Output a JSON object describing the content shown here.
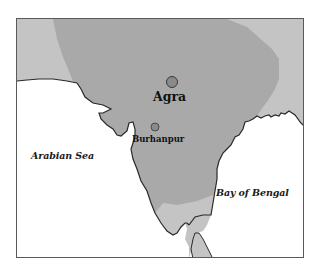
{
  "map": {
    "title": "",
    "colors": {
      "sea": "#ffffff",
      "land_outer": "#c4c4c4",
      "empire": "#a9a9a9",
      "coastline": "#2a2a2a",
      "city_marker": "#8a8a8a",
      "frame": "#5a5a5a"
    },
    "cities": [
      {
        "name": "Agra",
        "type": "major-city"
      },
      {
        "name": "Burhanpur",
        "type": "city"
      }
    ],
    "water_bodies": [
      {
        "name": "Arabian Sea"
      },
      {
        "name": "Bay of Bengal"
      }
    ]
  }
}
